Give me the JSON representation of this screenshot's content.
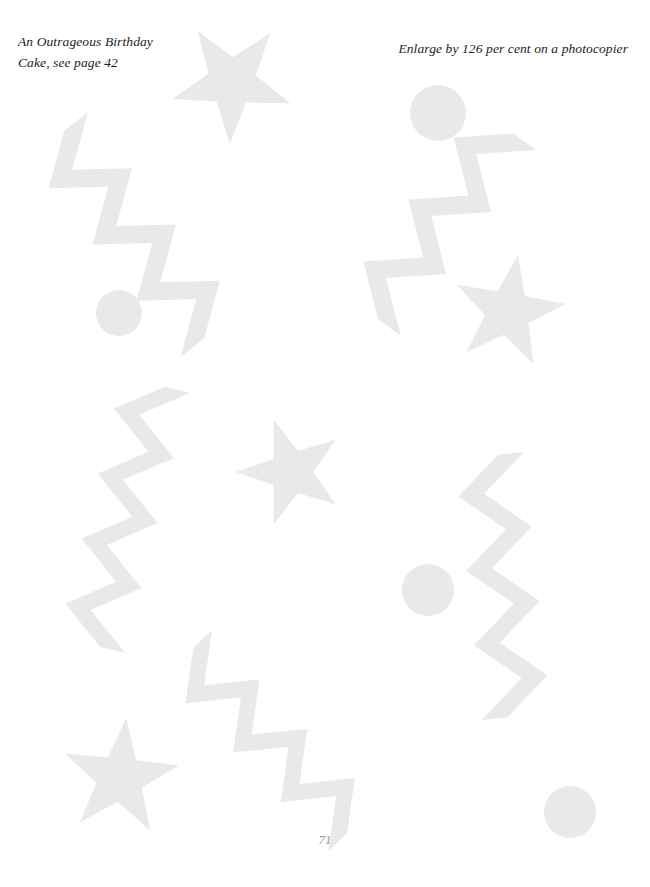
{
  "page": {
    "width": 650,
    "height": 887,
    "background_color": "#ffffff",
    "shape_color": "#e9e9e9",
    "page_number": "71"
  },
  "captions": {
    "left": "An Outrageous Birthday\nCake, see page 42",
    "right": "Enlarge by 126 per cent on a photocopier"
  },
  "artwork": {
    "description": "Scattered pale grey template shapes: five-pointed stars, jagged zigzag lightning bands, and plain circles",
    "fill": "#e9e9e9",
    "stars": [
      {
        "name": "star-top-centre",
        "cx": 232,
        "cy": 82,
        "r": 62,
        "rotation": 182
      },
      {
        "name": "star-upper-right",
        "cx": 508,
        "cy": 312,
        "r": 58,
        "rotation": 10
      },
      {
        "name": "star-middle-centre",
        "cx": 291,
        "cy": 472,
        "r": 55,
        "rotation": -18
      },
      {
        "name": "star-bottom-left",
        "cx": 120,
        "cy": 778,
        "r": 60,
        "rotation": 6
      }
    ],
    "circles": [
      {
        "name": "circle-upper-right",
        "cx": 438,
        "cy": 113,
        "r": 28
      },
      {
        "name": "circle-middle-left",
        "cx": 119,
        "cy": 313,
        "r": 23
      },
      {
        "name": "circle-lower-right",
        "cx": 428,
        "cy": 590,
        "r": 26
      },
      {
        "name": "circle-bottom-right",
        "cx": 570,
        "cy": 812,
        "r": 26
      }
    ],
    "zigzags": [
      {
        "name": "zigzag-upper-left",
        "x": 88,
        "y": 112,
        "length": 250,
        "angle": 52,
        "teeth": 7,
        "amplitude": 48,
        "band": 30
      },
      {
        "name": "zigzag-upper-right",
        "x": 536,
        "y": 150,
        "length": 230,
        "angle": 126,
        "teeth": 6,
        "amplitude": 46,
        "band": 28
      },
      {
        "name": "zigzag-middle-left",
        "x": 190,
        "y": 393,
        "length": 268,
        "angle": 104,
        "teeth": 8,
        "amplitude": 44,
        "band": 26
      },
      {
        "name": "zigzag-middle-right",
        "x": 524,
        "y": 452,
        "length": 262,
        "angle": 84,
        "teeth": 7,
        "amplitude": 44,
        "band": 26
      },
      {
        "name": "zigzag-bottom-centre",
        "x": 212,
        "y": 630,
        "length": 240,
        "angle": 46,
        "teeth": 7,
        "amplitude": 44,
        "band": 26
      }
    ]
  }
}
